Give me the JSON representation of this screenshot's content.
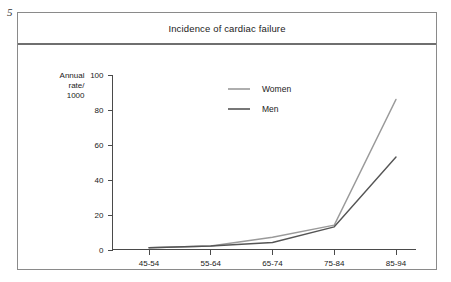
{
  "page": {
    "number": "5"
  },
  "figure": {
    "title": "Incidence of cardiac failure"
  },
  "axes": {
    "y_label_lines": [
      "Annual",
      "rate/",
      "1000"
    ],
    "y_ticks": [
      "0",
      "20",
      "40",
      "60",
      "80",
      "100"
    ],
    "x_ticks": [
      "45-54",
      "55-64",
      "65-74",
      "75-84",
      "85-94"
    ]
  },
  "legend": {
    "items": [
      {
        "label": "Women",
        "color": "#9a9a9a"
      },
      {
        "label": "Men",
        "color": "#555555"
      }
    ]
  },
  "colors": {
    "frame": "#8a8a8a",
    "title_rule": "#6f6f6f",
    "axis": "#4a4a4a",
    "women": "#9a9a9a",
    "men": "#555555",
    "text": "#1a1a1a",
    "background": "#ffffff"
  },
  "chart_data": {
    "type": "line",
    "title": "Incidence of cardiac failure",
    "xlabel": "",
    "ylabel": "Annual rate/ 1000",
    "categories": [
      "45-54",
      "55-64",
      "65-74",
      "75-84",
      "85-94"
    ],
    "series": [
      {
        "name": "Women",
        "color": "#9a9a9a",
        "values": [
          1,
          2,
          7,
          14,
          86
        ]
      },
      {
        "name": "Men",
        "color": "#555555",
        "values": [
          1,
          2,
          4,
          13,
          53
        ]
      }
    ],
    "ylim": [
      0,
      100
    ],
    "ytick_step": 20,
    "grid": false,
    "legend_position": "inside-top-center"
  }
}
